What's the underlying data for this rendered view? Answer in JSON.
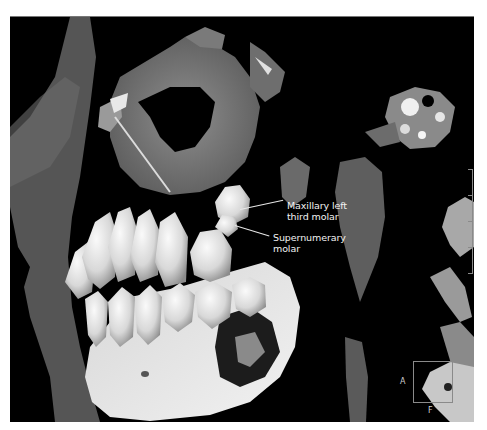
{
  "image": {
    "description": "3D CT volume rendering of the left side of the skull showing maxilla, mandible, dentition and soft tissue profile",
    "background_color": "#000000",
    "page_background": "#ffffff"
  },
  "annotations": [
    {
      "id": "maxillary-left-third-molar",
      "line1": "Maxillary left",
      "line2": "third molar"
    },
    {
      "id": "supernumerary-molar",
      "line1": "Supernumerary",
      "line2": "molar"
    }
  ],
  "orientation_indicator": {
    "left_letter": "A",
    "bottom_letter": "F"
  },
  "colors": {
    "soft_tissue": "#5e5e5e",
    "bone": "#bdbdbd",
    "teeth": "#e6e6e6",
    "mandible_cortex": "#f4f4f4",
    "label_text": "#f2f2f2"
  }
}
